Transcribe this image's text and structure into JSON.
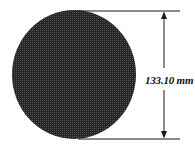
{
  "diagram": {
    "shape": "circle",
    "fill_color": "#2b2b2b",
    "pattern_color": "#4a4a4a",
    "line_color": "#1a1a1a",
    "dimension": {
      "label": "133.10 mm",
      "orientation": "vertical",
      "measures": "diameter"
    }
  }
}
